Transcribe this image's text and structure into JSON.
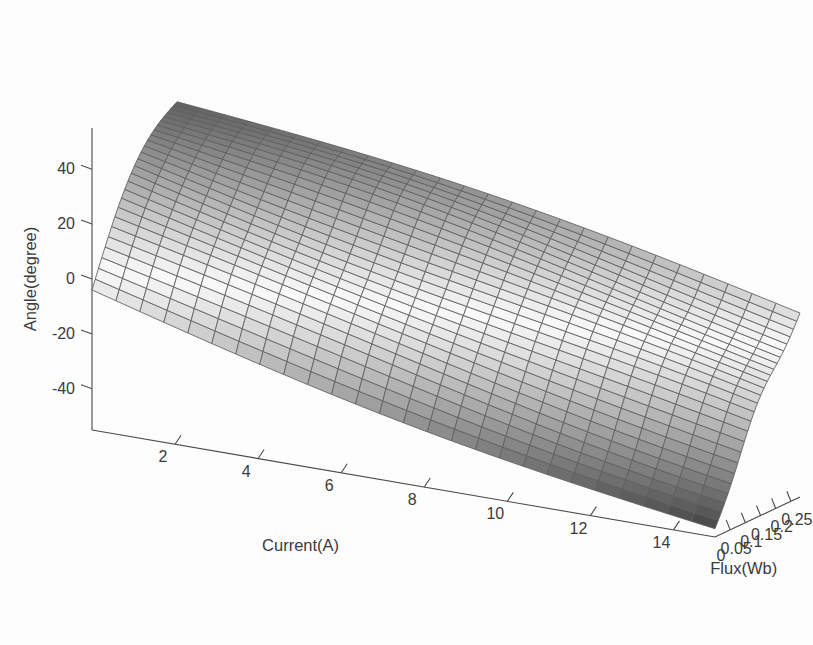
{
  "figure": {
    "width": 813,
    "height": 645,
    "background": "#ffffff",
    "renderer": "matlab-surf-3d",
    "mesh_line_color": "#5d5d5d",
    "axis_color": "#4a4a4a",
    "text_color": "#3b3b3b"
  },
  "chart_data": {
    "type": "surface",
    "title": "",
    "subtitle": "",
    "xlabel": "Current(A)",
    "ylabel": "Flux(Wb)",
    "zlabel": "Angle(degree)",
    "xlim": [
      0,
      15
    ],
    "ylim": [
      0,
      0.28
    ],
    "zlim": [
      -55,
      55
    ],
    "xticks": [
      2,
      4,
      6,
      8,
      10,
      12,
      14
    ],
    "xticklabels": [
      "2",
      "4",
      "6",
      "8",
      "10",
      "12",
      "14"
    ],
    "yticks": [
      0,
      0.05,
      0.1,
      0.15,
      0.2,
      0.25
    ],
    "yticklabels": [
      "0",
      "0.05",
      "0.1",
      "0.15",
      "0.2",
      "0.25"
    ],
    "zticks": [
      -40,
      -20,
      0,
      20,
      40
    ],
    "zticklabels": [
      "-40",
      "-20",
      "0",
      "20",
      "40"
    ],
    "origin_label": "0",
    "grid": false,
    "legend": null,
    "colormap": "gray",
    "shading": "faceted",
    "colorbar": false,
    "mesh_rows": 26,
    "mesh_cols": 26,
    "view": {
      "azimuth": -37.5,
      "elevation": 30
    },
    "x": [
      0,
      1,
      2,
      3,
      4,
      5,
      6,
      7,
      8,
      9,
      10,
      11,
      12,
      13,
      14,
      15
    ],
    "y": [
      0,
      0.02,
      0.04,
      0.06,
      0.08,
      0.1,
      0.12,
      0.14,
      0.16,
      0.18,
      0.2,
      0.22,
      0.24,
      0.26,
      0.28
    ],
    "z_corners": {
      "x_min_y_min": -4,
      "x_min_y_max": 50,
      "x_max_y_min": -52,
      "x_max_y_max": 12
    },
    "z_samples": [
      {
        "current": 0,
        "flux": 0.0,
        "angle": -4
      },
      {
        "current": 0,
        "flux": 0.14,
        "angle": 28
      },
      {
        "current": 0,
        "flux": 0.28,
        "angle": 50
      },
      {
        "current": 7,
        "flux": 0.0,
        "angle": -34
      },
      {
        "current": 7,
        "flux": 0.14,
        "angle": 6
      },
      {
        "current": 7,
        "flux": 0.28,
        "angle": 34
      },
      {
        "current": 15,
        "flux": 0.0,
        "angle": -52
      },
      {
        "current": 15,
        "flux": 0.14,
        "angle": -14
      },
      {
        "current": 15,
        "flux": 0.28,
        "angle": 12
      }
    ]
  }
}
